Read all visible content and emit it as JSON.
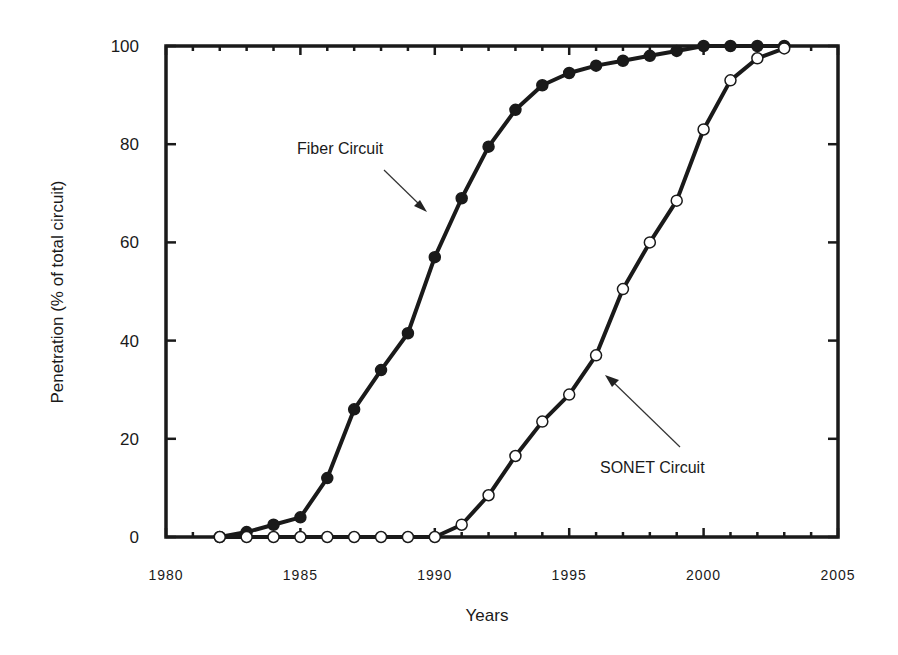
{
  "chart_data": {
    "type": "line",
    "title": "",
    "xlabel": "Years",
    "ylabel": "Penetration (% of total circuit)",
    "xlim": [
      1980,
      2005
    ],
    "ylim": [
      0,
      100
    ],
    "x_ticks": [
      1980,
      1985,
      1990,
      1995,
      2000,
      2005
    ],
    "y_ticks": [
      0,
      20,
      40,
      60,
      80,
      100
    ],
    "grid": false,
    "legend": "none (inline annotations)",
    "x": [
      1982,
      1983,
      1984,
      1985,
      1986,
      1987,
      1988,
      1989,
      1990,
      1991,
      1992,
      1993,
      1994,
      1995,
      1996,
      1997,
      1998,
      1999,
      2000,
      2001,
      2002,
      2003
    ],
    "series": [
      {
        "name": "Fiber Circuit",
        "marker": "filled-circle",
        "values": [
          0,
          1,
          2.5,
          4,
          12,
          26,
          34,
          41.5,
          57,
          69,
          79.5,
          87,
          92,
          94.5,
          96,
          97,
          98,
          99,
          100,
          100,
          100,
          100
        ]
      },
      {
        "name": "SONET Circuit",
        "marker": "open-circle",
        "values": [
          0,
          0,
          0,
          0,
          0,
          0,
          0,
          0,
          0,
          2.5,
          8.5,
          16.5,
          23.5,
          29,
          37,
          50.5,
          60,
          68.5,
          83,
          93,
          97.5,
          99.5
        ]
      }
    ],
    "annotations": [
      {
        "text": "Fiber Circuit",
        "arrow_to_year": 1990.5,
        "arrow_to_value": 66
      },
      {
        "text": "SONET Circuit",
        "arrow_to_year": 1996.6,
        "arrow_to_value": 33
      }
    ]
  },
  "labels": {
    "x_axis_title": "Years",
    "y_axis_title": "Penetration (% of total circuit)",
    "fiber_annotation": "Fiber Circuit",
    "sonet_annotation": "SONET Circuit"
  }
}
